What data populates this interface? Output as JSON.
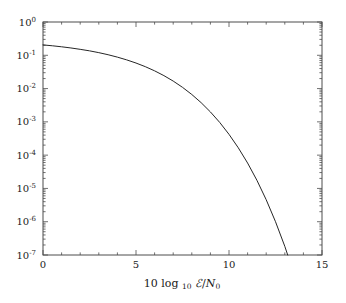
{
  "chart_data": {
    "type": "line",
    "title": "",
    "subtitle": "",
    "xlabel": "10 log₁₀ ℰ/N₀",
    "ylabel": "",
    "xscale": "linear",
    "yscale": "log",
    "xlim": [
      0,
      15
    ],
    "ylim": [
      1e-07,
      1
    ],
    "grid": false,
    "legend": null,
    "legend_position": "none",
    "xticks": [
      0,
      5,
      10,
      15
    ],
    "xtick_labels": [
      "0",
      "5",
      "10",
      "15"
    ],
    "yticks": [
      1,
      0.1,
      0.01,
      0.001,
      0.0001,
      1e-05,
      1e-06,
      1e-07
    ],
    "ytick_labels": [
      "10^0",
      "10^-1",
      "10^-2",
      "10^-3",
      "10^-4",
      "10^-5",
      "10^-6",
      "10^-7"
    ],
    "ytick_mantissa": "10",
    "ytick_exponents": [
      "0",
      "-1",
      "-2",
      "-3",
      "-4",
      "-5",
      "-6",
      "-7"
    ],
    "minor_ticks": true,
    "tick_direction": "in",
    "series": [
      {
        "name": "error probability",
        "color": "#262626",
        "linewidth": 1,
        "x": [
          0.0,
          0.5,
          1.0,
          1.5,
          2.0,
          2.5,
          3.0,
          3.5,
          4.0,
          4.5,
          5.0,
          5.5,
          6.0,
          6.5,
          7.0,
          7.5,
          8.0,
          8.5,
          9.0,
          9.5,
          10.0,
          10.5,
          11.0,
          11.5,
          12.0,
          12.5,
          13.0,
          13.5,
          14.0,
          14.5,
          15.0
        ],
        "y": [
          0.205,
          0.193,
          0.18,
          0.166,
          0.151,
          0.136,
          0.12,
          0.104,
          0.088,
          0.0727,
          0.0585,
          0.0455,
          0.0341,
          0.0245,
          0.0168,
          0.0109,
          0.00664,
          0.00378,
          0.00199,
          0.000963,
          0.000422,
          0.000166,
          5.79e-05,
          1.76e-05,
          4.58e-06,
          1e-06,
          1.82e-07,
          2.66e-08,
          3.07e-09,
          2.72e-10,
          1.81e-11
        ]
      }
    ],
    "annotations": []
  },
  "axis": {
    "x_label_text": "10 log",
    "x_label_sub": "10",
    "x_label_script_e": "ℰ",
    "x_label_slash": "/",
    "x_label_n": "N",
    "x_label_n_sub": "0"
  },
  "style": {
    "background": "#ffffff",
    "frame_color": "#4d4d4d",
    "curve_color": "#262626",
    "text_color": "#1a1a1a"
  }
}
